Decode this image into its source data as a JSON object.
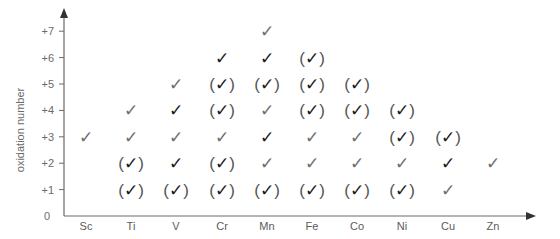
{
  "chart_data": {
    "type": "table",
    "title": "",
    "xlabel": "",
    "ylabel": "oxidation number",
    "y_ticks": [
      "0",
      "+1",
      "+2",
      "+3",
      "+4",
      "+5",
      "+6",
      "+7"
    ],
    "categories": [
      "Sc",
      "Ti",
      "V",
      "Cr",
      "Mn",
      "Fe",
      "Co",
      "Ni",
      "Cu",
      "Zn"
    ],
    "legend_notes": {
      "check_black": "common oxidation state (bold)",
      "check_gray": "known oxidation state",
      "check_in_parentheses": "rare / unstable oxidation state"
    },
    "marks": {
      "Sc": [
        {
          "ox": 3,
          "style": "gray"
        }
      ],
      "Ti": [
        {
          "ox": 1,
          "style": "paren"
        },
        {
          "ox": 2,
          "style": "paren"
        },
        {
          "ox": 3,
          "style": "gray"
        },
        {
          "ox": 4,
          "style": "gray"
        }
      ],
      "V": [
        {
          "ox": 1,
          "style": "paren"
        },
        {
          "ox": 2,
          "style": "black"
        },
        {
          "ox": 3,
          "style": "gray"
        },
        {
          "ox": 4,
          "style": "black"
        },
        {
          "ox": 5,
          "style": "gray"
        }
      ],
      "Cr": [
        {
          "ox": 1,
          "style": "paren"
        },
        {
          "ox": 2,
          "style": "paren"
        },
        {
          "ox": 3,
          "style": "gray"
        },
        {
          "ox": 4,
          "style": "paren"
        },
        {
          "ox": 5,
          "style": "paren"
        },
        {
          "ox": 6,
          "style": "black"
        }
      ],
      "Mn": [
        {
          "ox": 1,
          "style": "paren"
        },
        {
          "ox": 2,
          "style": "gray"
        },
        {
          "ox": 3,
          "style": "black"
        },
        {
          "ox": 4,
          "style": "gray"
        },
        {
          "ox": 5,
          "style": "paren"
        },
        {
          "ox": 6,
          "style": "black"
        },
        {
          "ox": 7,
          "style": "gray"
        }
      ],
      "Fe": [
        {
          "ox": 1,
          "style": "paren"
        },
        {
          "ox": 2,
          "style": "gray"
        },
        {
          "ox": 3,
          "style": "gray"
        },
        {
          "ox": 4,
          "style": "paren"
        },
        {
          "ox": 5,
          "style": "paren"
        },
        {
          "ox": 6,
          "style": "paren"
        }
      ],
      "Co": [
        {
          "ox": 1,
          "style": "paren"
        },
        {
          "ox": 2,
          "style": "gray"
        },
        {
          "ox": 3,
          "style": "gray"
        },
        {
          "ox": 4,
          "style": "paren"
        },
        {
          "ox": 5,
          "style": "paren"
        }
      ],
      "Ni": [
        {
          "ox": 1,
          "style": "paren"
        },
        {
          "ox": 2,
          "style": "gray"
        },
        {
          "ox": 3,
          "style": "paren"
        },
        {
          "ox": 4,
          "style": "paren"
        }
      ],
      "Cu": [
        {
          "ox": 1,
          "style": "gray"
        },
        {
          "ox": 2,
          "style": "black"
        },
        {
          "ox": 3,
          "style": "paren"
        }
      ],
      "Zn": [
        {
          "ox": 2,
          "style": "gray"
        }
      ]
    },
    "ylim": [
      0,
      7.5
    ],
    "grid": false
  },
  "glyphs": {
    "check": "✓",
    "open_paren": "(",
    "close_paren": ")"
  },
  "colors": {
    "axis": "#6a6a6a",
    "check_black": "#1a1a1a",
    "check_gray": "#6e6e6e",
    "label": "#5a5a5a"
  }
}
